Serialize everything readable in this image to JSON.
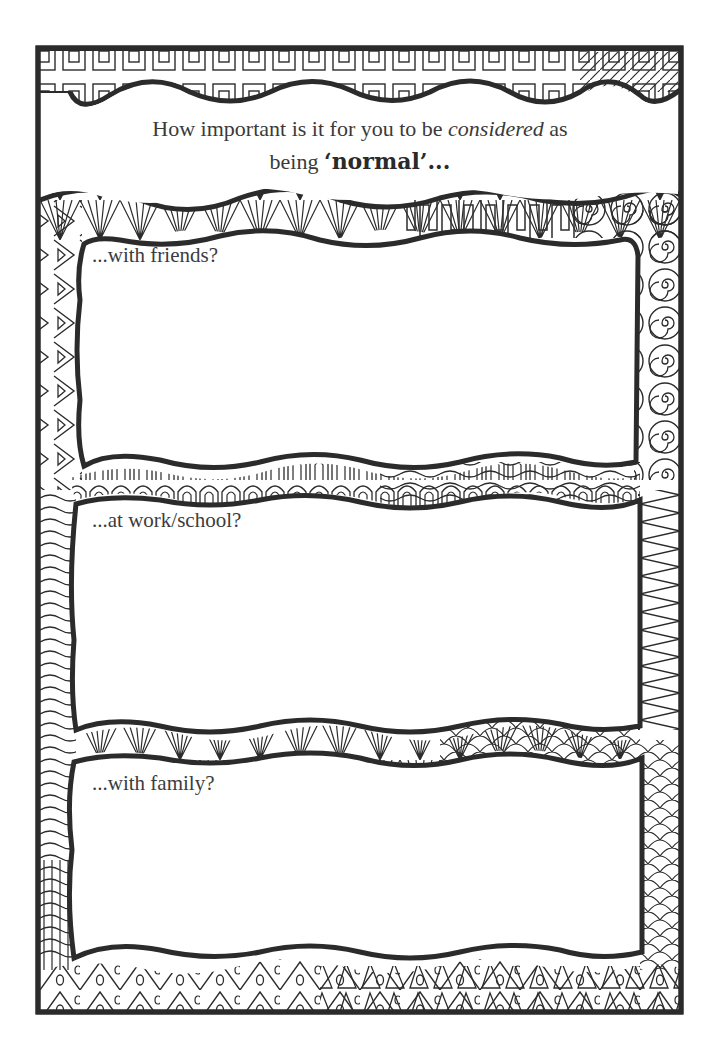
{
  "worksheet": {
    "title_prefix": "How important is it for you to be ",
    "title_emphasis": "considered",
    "title_middle": " as",
    "title_line2_prefix": "being ",
    "title_bold": "‘normal’...",
    "sections": [
      {
        "label": "...with friends?"
      },
      {
        "label": "...at work/school?"
      },
      {
        "label": "...with family?"
      }
    ]
  },
  "colors": {
    "ink": "#2b2b2b",
    "paper": "#ffffff",
    "text": "#3a3a3a"
  }
}
